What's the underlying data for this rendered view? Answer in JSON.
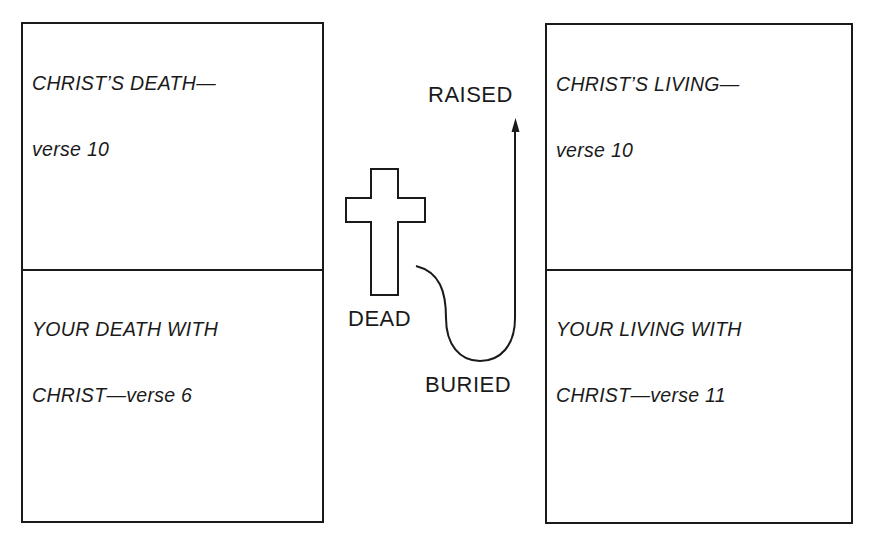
{
  "diagram": {
    "left_panel": {
      "top": {
        "line1": "CHRIST’S DEATH—",
        "line2": "verse 10"
      },
      "bottom": {
        "line1": "YOUR DEATH WITH",
        "line2": "CHRIST—verse 6"
      }
    },
    "right_panel": {
      "top": {
        "line1": "CHRIST’S LIVING—",
        "line2": "verse 10"
      },
      "bottom": {
        "line1": "YOUR LIVING WITH",
        "line2": "CHRIST—verse 11"
      }
    },
    "center": {
      "icon": "cross-icon",
      "labels": {
        "dead": "DEAD",
        "buried": "BURIED",
        "raised": "RAISED"
      },
      "path": "curve from cross down through burial up to arrow"
    },
    "colors": {
      "ink": "#1a1a1a",
      "background": "#ffffff"
    }
  }
}
